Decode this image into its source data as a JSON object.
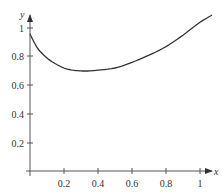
{
  "chart_data": {
    "type": "line",
    "title": "",
    "xlabel": "x",
    "ylabel": "y",
    "xlim": [
      0,
      1.07
    ],
    "ylim": [
      0,
      1.05
    ],
    "grid": false,
    "legend": null,
    "x_ticks": [
      "0.2",
      "0.4",
      "0.6",
      "0.8",
      "1"
    ],
    "y_ticks": [
      "0.2",
      "0.4",
      "0.6",
      "0.8",
      "1"
    ],
    "series": [
      {
        "name": "curve",
        "x": [
          0.0,
          0.02,
          0.05,
          0.1,
          0.15,
          0.2,
          0.25,
          0.3,
          0.35,
          0.4,
          0.5,
          0.6,
          0.7,
          0.8,
          0.9,
          1.0,
          1.07
        ],
        "y": [
          0.96,
          0.91,
          0.85,
          0.79,
          0.75,
          0.72,
          0.705,
          0.7,
          0.7,
          0.705,
          0.72,
          0.76,
          0.81,
          0.87,
          0.95,
          1.04,
          1.09
        ]
      }
    ],
    "colors": {
      "curve": "#333333",
      "axes": "#555555"
    }
  }
}
